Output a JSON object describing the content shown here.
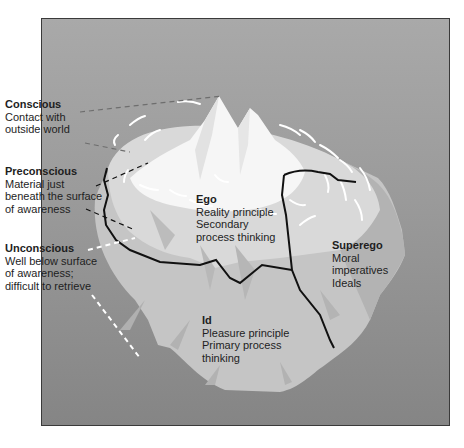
{
  "diagram": {
    "type": "iceberg-model",
    "colors": {
      "background_top": "#a9a9a9",
      "background_bottom": "#858585",
      "iceberg_tip": "#ffffff",
      "iceberg_upper": "#d6d6d6",
      "iceberg_lower": "#c4c4c4",
      "boundary_line": "#111111",
      "text": "#1e1e1e"
    },
    "levels": [
      {
        "id": "conscious",
        "title": "Conscious",
        "lines": [
          "Contact with",
          "outside world"
        ]
      },
      {
        "id": "preconscious",
        "title": "Preconscious",
        "lines": [
          "Material just",
          "beneath the surface",
          "of awareness"
        ]
      },
      {
        "id": "unconscious",
        "title": "Unconscious",
        "lines": [
          "Well below surface",
          "of awareness;",
          "difficult to retrieve"
        ]
      }
    ],
    "structures": [
      {
        "id": "ego",
        "title": "Ego",
        "lines": [
          "Reality principle",
          "Secondary",
          "process thinking"
        ]
      },
      {
        "id": "superego",
        "title": "Superego",
        "lines": [
          "Moral",
          "imperatives",
          "Ideals"
        ]
      },
      {
        "id": "id",
        "title": "Id",
        "lines": [
          "Pleasure principle",
          "Primary process",
          "thinking"
        ]
      }
    ]
  }
}
